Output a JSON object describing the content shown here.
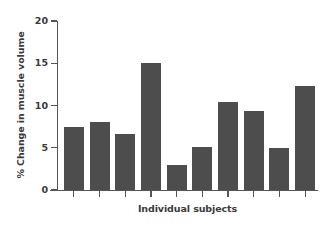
{
  "chart_data": {
    "type": "bar",
    "title": "",
    "subtitle": "",
    "xlabel": "Individual subjects",
    "ylabel": "% Change in muscle volume",
    "categories": [
      "1",
      "2",
      "3",
      "4",
      "5",
      "6",
      "7",
      "8",
      "9",
      "10"
    ],
    "values": [
      7.5,
      8.0,
      6.6,
      15.0,
      3.0,
      5.1,
      10.4,
      9.3,
      5.0,
      12.3
    ],
    "ylim": [
      0,
      20
    ],
    "yticks": [
      0,
      5,
      10,
      15,
      20
    ],
    "ytick_labels": [
      "0",
      "5",
      "10",
      "15",
      "20"
    ],
    "xtick_labels": [
      "",
      "",
      "",
      "",
      "",
      "",
      "",
      "",
      "",
      ""
    ],
    "grid": false,
    "legend": null,
    "legend_position": "none",
    "bar_color": "#4d4d4d",
    "axis_color": "#555555",
    "text_color": "#3a3a3a",
    "background_color": "#ffffff"
  }
}
